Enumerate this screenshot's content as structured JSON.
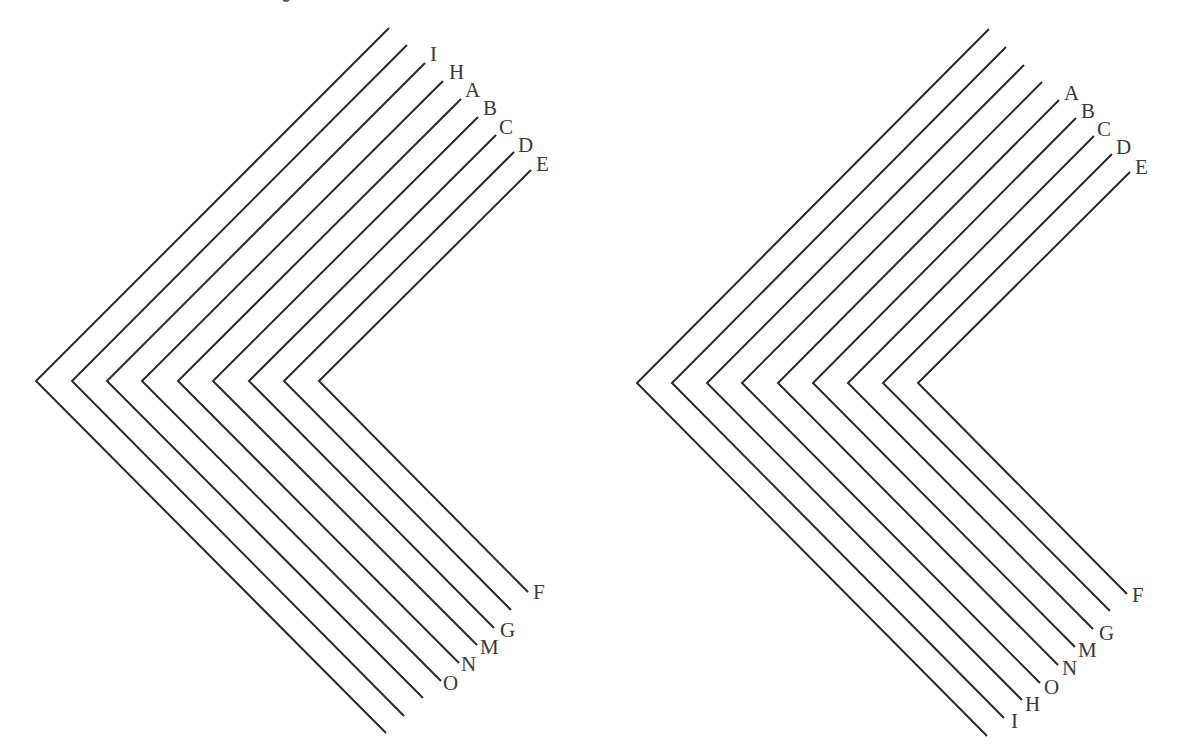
{
  "figure": {
    "style": {
      "line_color": "#2a2a2a",
      "label_color": "#3a3a3a",
      "background": "#ffffff"
    },
    "panels": [
      {
        "id": "left",
        "chevrons": [
          {
            "top": [
              389,
              28
            ],
            "vertex": [
              36,
              381
            ],
            "bottom": [
              386,
              733
            ],
            "top_label": "",
            "bottom_label": ""
          },
          {
            "top": [
              407,
              45
            ],
            "vertex": [
              72,
              381
            ],
            "bottom": [
              404,
              716
            ],
            "top_label": "",
            "bottom_label": ""
          },
          {
            "top": [
              425,
              63
            ],
            "vertex": [
              107,
              381
            ],
            "bottom": [
              423,
              698
            ],
            "top_label": "I",
            "bottom_label": ""
          },
          {
            "top": [
              443,
              81
            ],
            "vertex": [
              142,
              381
            ],
            "bottom": [
              441,
              681
            ],
            "top_label": "H",
            "bottom_label": "O"
          },
          {
            "top": [
              461,
              99
            ],
            "vertex": [
              178,
              381
            ],
            "bottom": [
              459,
              663
            ],
            "top_label": "A",
            "bottom_label": "N"
          },
          {
            "top": [
              478,
              117
            ],
            "vertex": [
              213,
              381
            ],
            "bottom": [
              477,
              645
            ],
            "top_label": "B",
            "bottom_label": "M"
          },
          {
            "top": [
              496,
              135
            ],
            "vertex": [
              249,
              381
            ],
            "bottom": [
              494,
              628
            ],
            "top_label": "C",
            "bottom_label": "G"
          },
          {
            "top": [
              514,
              152
            ],
            "vertex": [
              284,
              381
            ],
            "bottom": [
              511,
              610
            ],
            "top_label": "D",
            "bottom_label": ""
          },
          {
            "top": [
              531,
              170
            ],
            "vertex": [
              319,
              381
            ],
            "bottom": [
              528,
              592
            ],
            "top_label": "E",
            "bottom_label": "F"
          }
        ],
        "labels": [
          {
            "text": "I",
            "x": 430,
            "y": 44
          },
          {
            "text": "H",
            "x": 449,
            "y": 62
          },
          {
            "text": "A",
            "x": 465,
            "y": 80
          },
          {
            "text": "B",
            "x": 483,
            "y": 98
          },
          {
            "text": "C",
            "x": 499,
            "y": 117
          },
          {
            "text": "D",
            "x": 518,
            "y": 135
          },
          {
            "text": "E",
            "x": 536,
            "y": 154
          },
          {
            "text": "F",
            "x": 533,
            "y": 582
          },
          {
            "text": "G",
            "x": 500,
            "y": 620
          },
          {
            "text": "M",
            "x": 480,
            "y": 637
          },
          {
            "text": "N",
            "x": 461,
            "y": 654
          },
          {
            "text": "O",
            "x": 443,
            "y": 673
          }
        ]
      },
      {
        "id": "right",
        "chevrons": [
          {
            "top": [
              989,
              29
            ],
            "vertex": [
              637,
              383
            ],
            "bottom": [
              987,
              736
            ],
            "top_label": "",
            "bottom_label": ""
          },
          {
            "top": [
              1006,
              47
            ],
            "vertex": [
              672,
              383
            ],
            "bottom": [
              1004,
              718
            ],
            "top_label": "",
            "bottom_label": "I"
          },
          {
            "top": [
              1024,
              65
            ],
            "vertex": [
              707,
              383
            ],
            "bottom": [
              1022,
              700
            ],
            "top_label": "",
            "bottom_label": "H"
          },
          {
            "top": [
              1042,
              82
            ],
            "vertex": [
              742,
              383
            ],
            "bottom": [
              1040,
              683
            ],
            "top_label": "",
            "bottom_label": "O"
          },
          {
            "top": [
              1059,
              100
            ],
            "vertex": [
              778,
              383
            ],
            "bottom": [
              1058,
              665
            ],
            "top_label": "A",
            "bottom_label": "N"
          },
          {
            "top": [
              1076,
              118
            ],
            "vertex": [
              813,
              383
            ],
            "bottom": [
              1075,
              647
            ],
            "top_label": "B",
            "bottom_label": "M"
          },
          {
            "top": [
              1094,
              136
            ],
            "vertex": [
              848,
              383
            ],
            "bottom": [
              1093,
              629
            ],
            "top_label": "C",
            "bottom_label": "G"
          },
          {
            "top": [
              1112,
              154
            ],
            "vertex": [
              883,
              383
            ],
            "bottom": [
              1110,
              611
            ],
            "top_label": "D",
            "bottom_label": ""
          },
          {
            "top": [
              1130,
              172
            ],
            "vertex": [
              918,
              383
            ],
            "bottom": [
              1127,
              594
            ],
            "top_label": "E",
            "bottom_label": "F"
          }
        ],
        "labels": [
          {
            "text": "A",
            "x": 1064,
            "y": 83
          },
          {
            "text": "B",
            "x": 1081,
            "y": 101
          },
          {
            "text": "C",
            "x": 1097,
            "y": 119
          },
          {
            "text": "D",
            "x": 1116,
            "y": 137
          },
          {
            "text": "E",
            "x": 1135,
            "y": 157
          },
          {
            "text": "F",
            "x": 1132,
            "y": 585
          },
          {
            "text": "G",
            "x": 1099,
            "y": 623
          },
          {
            "text": "M",
            "x": 1078,
            "y": 640
          },
          {
            "text": "N",
            "x": 1062,
            "y": 658
          },
          {
            "text": "O",
            "x": 1044,
            "y": 677
          },
          {
            "text": "H",
            "x": 1025,
            "y": 694
          },
          {
            "text": "I",
            "x": 1011,
            "y": 711
          }
        ]
      }
    ]
  }
}
